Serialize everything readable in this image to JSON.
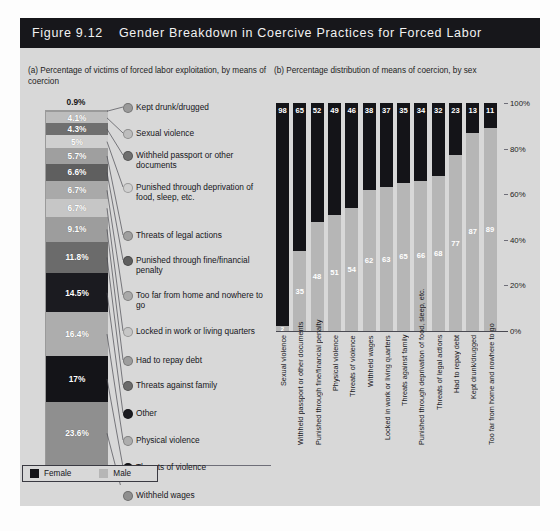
{
  "figure": {
    "number": "Figure 9.12",
    "title": "Gender Breakdown in Coercive Practices for Forced Labor"
  },
  "panel_a": {
    "header": "(a) Percentage of victims of forced labor exploitation, by means of coercion"
  },
  "panel_b": {
    "header": "(b) Percentage distribution of means of coercion, by sex"
  },
  "legend": {
    "female_label": "Female",
    "male_label": "Male",
    "female_color": "#141418",
    "male_color": "#b6b6b6"
  },
  "chart_data": [
    {
      "type": "bar",
      "id": "panel-a-stacked",
      "title": "(a) Percentage of victims of forced labor exploitation, by means of coercion",
      "orientation": "vertical-stacked-single-column",
      "xlabel": "",
      "ylabel": "",
      "categories": [
        "Kept drunk/drugged",
        "Sexual violence",
        "Withheld passport or other documents",
        "Punished through deprivation of food, sleep, etc.",
        "Threats of legal actions",
        "Punished through fine/financial penalty",
        "Too far from home and nowhere to go",
        "Locked in work or living quarters",
        "Had to repay debt",
        "Threats against family",
        "Other",
        "Physical violence",
        "Threats of violence",
        "Withheld wages"
      ],
      "values": [
        0.9,
        4.1,
        4.3,
        5,
        5.7,
        6.6,
        6.7,
        6.7,
        9.1,
        11.8,
        14.5,
        16.4,
        17,
        23.6
      ],
      "value_labels": [
        "0.9%",
        "4.1%",
        "4.3%",
        "5%",
        "5.7%",
        "6.6%",
        "6.7%",
        "6.7%",
        "9.1%",
        "11.8%",
        "14.5%",
        "16.4%",
        "17%",
        "23.6%"
      ],
      "segment_colors": [
        "#9a9a9a",
        "#bdbdbd",
        "#6f6f6f",
        "#cfcfcf",
        "#9f9f9f",
        "#5f5f5f",
        "#a9a9a9",
        "#c6c6c6",
        "#9d9d9d",
        "#6b6b6b",
        "#1b1b20",
        "#adadad",
        "#141418",
        "#8f8f8f"
      ],
      "note": "segment 0.9% label drawn above the column"
    },
    {
      "type": "bar",
      "id": "panel-b-stacked-100",
      "title": "(b) Percentage distribution of means of coercion, by sex",
      "stacked": true,
      "stack_total": 100,
      "xlabel": "",
      "ylabel": "",
      "ylim": [
        0,
        100
      ],
      "yticks": [
        0,
        20,
        40,
        60,
        80,
        100
      ],
      "ytick_labels": [
        "0%",
        "20%",
        "40%",
        "60%",
        "80%",
        "100%"
      ],
      "grid": false,
      "legend_position": "bottom-left",
      "categories": [
        "Sexual violence",
        "Withheld passport or other documents",
        "Punished through fine/financial penalty",
        "Physical violence",
        "Threats of violence",
        "Withheld wages",
        "Locked in work or living quarters",
        "Threats against family",
        "Punished through deprivation of food, sleep, etc.",
        "Threats of legal actions",
        "Had to repay debt",
        "Kept drunk/drugged",
        "Too far from home and nowhere to go"
      ],
      "series": [
        {
          "name": "Female",
          "color": "#141418",
          "values": [
            98,
            65,
            52,
            49,
            46,
            38,
            37,
            35,
            34,
            32,
            23,
            13,
            11
          ]
        },
        {
          "name": "Male",
          "color": "#b6b6b6",
          "values": [
            2,
            35,
            48,
            51,
            54,
            62,
            63,
            65,
            66,
            68,
            77,
            87,
            89
          ]
        }
      ]
    }
  ]
}
